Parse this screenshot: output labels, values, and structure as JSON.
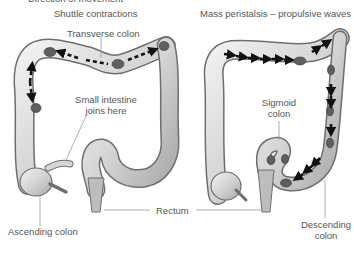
{
  "figure": {
    "cut_off_heading": "Direction of movement",
    "left_panel": {
      "title": "Shuttle contractions",
      "labels": {
        "transverse": "Transverse colon",
        "small_intestine": "Small intestine\njoins here",
        "small_intestine_line1": "Small intestine",
        "small_intestine_line2": "joins here",
        "ascending": "Ascending colon"
      }
    },
    "right_panel": {
      "title": "Mass peristalsis – propulsive waves",
      "labels": {
        "sigmoid_line1": "Sigmoid",
        "sigmoid_line2": "colon",
        "descending_line1": "Descending",
        "descending_line2": "colon"
      }
    },
    "shared_labels": {
      "rectum": "Rectum"
    },
    "colors": {
      "colon_fill": "#d8d8d8",
      "colon_outline": "#6e6e6e",
      "feces": "#5f5f5f",
      "arrow": "#111111",
      "text": "#555555",
      "leader_line": "#9a9a9a"
    }
  }
}
